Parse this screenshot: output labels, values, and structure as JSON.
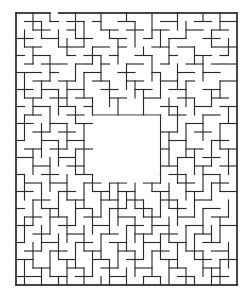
{
  "page": {
    "kind": "maze-puzzle-image",
    "background_color": "#ffffff",
    "width": 252,
    "height": 299
  },
  "header": {
    "name": "top-dark-bar",
    "color": "#3c3c3c",
    "x": 0,
    "y": 0,
    "width": 246,
    "height": 9
  },
  "maze": {
    "title": "",
    "wall_color": "#2b2b2b",
    "path_color": "#ffffff",
    "origin_x": 16,
    "origin_y": 13,
    "cell": 8.5,
    "cols": 26,
    "rows": 32,
    "border": {
      "top_gap_cells": [
        4
      ],
      "bottom_gap_cells": [],
      "left_gap_cells": [],
      "right_gap_cells": []
    },
    "center_room": {
      "col": 9,
      "row": 12,
      "cols": 8,
      "rows": 8
    },
    "h_walls": [
      [
        0,
        0,
        4
      ],
      [
        5,
        0,
        26
      ],
      [
        1,
        1,
        3
      ],
      [
        4,
        1,
        5
      ],
      [
        6,
        1,
        8
      ],
      [
        9,
        1,
        10
      ],
      [
        12,
        1,
        14
      ],
      [
        17,
        1,
        19
      ],
      [
        21,
        1,
        23
      ],
      [
        24,
        1,
        26
      ],
      [
        2,
        2,
        4
      ],
      [
        6,
        2,
        7
      ],
      [
        10,
        2,
        12
      ],
      [
        13,
        2,
        15
      ],
      [
        16,
        2,
        18
      ],
      [
        20,
        2,
        22
      ],
      [
        23,
        2,
        25
      ],
      [
        0,
        3,
        2
      ],
      [
        3,
        3,
        5
      ],
      [
        7,
        3,
        9
      ],
      [
        11,
        3,
        13
      ],
      [
        15,
        3,
        16
      ],
      [
        18,
        3,
        20
      ],
      [
        22,
        3,
        24
      ],
      [
        1,
        4,
        3
      ],
      [
        5,
        4,
        8
      ],
      [
        9,
        4,
        11
      ],
      [
        12,
        4,
        13
      ],
      [
        16,
        4,
        18
      ],
      [
        19,
        4,
        21
      ],
      [
        23,
        4,
        26
      ],
      [
        0,
        5,
        1
      ],
      [
        2,
        5,
        4
      ],
      [
        6,
        5,
        7
      ],
      [
        8,
        5,
        10
      ],
      [
        11,
        5,
        12
      ],
      [
        14,
        5,
        16
      ],
      [
        18,
        5,
        19
      ],
      [
        21,
        5,
        23
      ],
      [
        24,
        5,
        25
      ],
      [
        1,
        6,
        2
      ],
      [
        3,
        6,
        6
      ],
      [
        7,
        6,
        9
      ],
      [
        10,
        6,
        11
      ],
      [
        13,
        6,
        15
      ],
      [
        17,
        6,
        18
      ],
      [
        20,
        6,
        22
      ],
      [
        23,
        6,
        26
      ],
      [
        0,
        7,
        3
      ],
      [
        4,
        7,
        5
      ],
      [
        8,
        7,
        10
      ],
      [
        12,
        7,
        14
      ],
      [
        16,
        7,
        17
      ],
      [
        19,
        7,
        21
      ],
      [
        22,
        7,
        24
      ],
      [
        2,
        8,
        4
      ],
      [
        5,
        8,
        7
      ],
      [
        9,
        8,
        11
      ],
      [
        13,
        8,
        15
      ],
      [
        17,
        8,
        19
      ],
      [
        20,
        8,
        21
      ],
      [
        24,
        8,
        26
      ],
      [
        0,
        9,
        2
      ],
      [
        3,
        9,
        5
      ],
      [
        6,
        9,
        8
      ],
      [
        10,
        9,
        12
      ],
      [
        14,
        9,
        16
      ],
      [
        18,
        9,
        20
      ],
      [
        22,
        9,
        24
      ],
      [
        1,
        10,
        3
      ],
      [
        4,
        10,
        6
      ],
      [
        7,
        10,
        9
      ],
      [
        11,
        10,
        13
      ],
      [
        15,
        10,
        17
      ],
      [
        19,
        10,
        21
      ],
      [
        23,
        10,
        25
      ],
      [
        0,
        11,
        1
      ],
      [
        2,
        11,
        4
      ],
      [
        5,
        11,
        7
      ],
      [
        8,
        11,
        9
      ],
      [
        17,
        11,
        19
      ],
      [
        21,
        11,
        23
      ],
      [
        24,
        11,
        26
      ],
      [
        1,
        12,
        3
      ],
      [
        6,
        12,
        8
      ],
      [
        9,
        12,
        17
      ],
      [
        18,
        12,
        20
      ],
      [
        22,
        12,
        24
      ],
      [
        0,
        13,
        2
      ],
      [
        4,
        13,
        6
      ],
      [
        7,
        13,
        9
      ],
      [
        20,
        13,
        22
      ],
      [
        24,
        13,
        26
      ],
      [
        2,
        14,
        4
      ],
      [
        5,
        14,
        7
      ],
      [
        17,
        14,
        19
      ],
      [
        21,
        14,
        23
      ],
      [
        0,
        15,
        1
      ],
      [
        3,
        15,
        5
      ],
      [
        6,
        15,
        8
      ],
      [
        18,
        15,
        20
      ],
      [
        23,
        15,
        25
      ],
      [
        1,
        16,
        3
      ],
      [
        4,
        16,
        6
      ],
      [
        7,
        16,
        9
      ],
      [
        17,
        16,
        18
      ],
      [
        20,
        16,
        22
      ],
      [
        24,
        16,
        26
      ],
      [
        0,
        17,
        2
      ],
      [
        5,
        17,
        7
      ],
      [
        19,
        17,
        21
      ],
      [
        22,
        17,
        24
      ],
      [
        2,
        18,
        4
      ],
      [
        6,
        18,
        8
      ],
      [
        17,
        18,
        19
      ],
      [
        21,
        18,
        23
      ],
      [
        24,
        18,
        26
      ],
      [
        0,
        19,
        1
      ],
      [
        3,
        19,
        5
      ],
      [
        7,
        19,
        9
      ],
      [
        9,
        19,
        17
      ],
      [
        18,
        19,
        20
      ],
      [
        22,
        19,
        24
      ],
      [
        1,
        20,
        3
      ],
      [
        4,
        20,
        6
      ],
      [
        8,
        20,
        10
      ],
      [
        11,
        20,
        13
      ],
      [
        15,
        20,
        17
      ],
      [
        19,
        20,
        21
      ],
      [
        23,
        20,
        25
      ],
      [
        0,
        21,
        2
      ],
      [
        5,
        21,
        7
      ],
      [
        9,
        21,
        11
      ],
      [
        12,
        21,
        14
      ],
      [
        16,
        21,
        18
      ],
      [
        20,
        21,
        22
      ],
      [
        24,
        21,
        26
      ],
      [
        2,
        22,
        4
      ],
      [
        6,
        22,
        8
      ],
      [
        10,
        22,
        12
      ],
      [
        13,
        22,
        15
      ],
      [
        17,
        22,
        19
      ],
      [
        21,
        22,
        23
      ],
      [
        0,
        23,
        1
      ],
      [
        3,
        23,
        5
      ],
      [
        7,
        23,
        9
      ],
      [
        11,
        23,
        13
      ],
      [
        14,
        23,
        16
      ],
      [
        18,
        23,
        20
      ],
      [
        22,
        23,
        24
      ],
      [
        1,
        24,
        3
      ],
      [
        4,
        24,
        6
      ],
      [
        8,
        24,
        10
      ],
      [
        12,
        24,
        14
      ],
      [
        15,
        24,
        17
      ],
      [
        19,
        24,
        21
      ],
      [
        23,
        24,
        25
      ],
      [
        0,
        25,
        2
      ],
      [
        5,
        25,
        7
      ],
      [
        9,
        25,
        11
      ],
      [
        13,
        25,
        15
      ],
      [
        16,
        25,
        18
      ],
      [
        20,
        25,
        22
      ],
      [
        24,
        25,
        26
      ],
      [
        2,
        26,
        4
      ],
      [
        6,
        26,
        8
      ],
      [
        10,
        26,
        12
      ],
      [
        14,
        26,
        16
      ],
      [
        17,
        26,
        19
      ],
      [
        21,
        26,
        23
      ],
      [
        0,
        27,
        1
      ],
      [
        3,
        27,
        5
      ],
      [
        7,
        27,
        9
      ],
      [
        11,
        27,
        13
      ],
      [
        15,
        27,
        17
      ],
      [
        18,
        27,
        20
      ],
      [
        22,
        27,
        24
      ],
      [
        1,
        28,
        3
      ],
      [
        4,
        28,
        6
      ],
      [
        8,
        28,
        10
      ],
      [
        12,
        28,
        14
      ],
      [
        16,
        28,
        18
      ],
      [
        20,
        28,
        22
      ],
      [
        23,
        28,
        25
      ],
      [
        0,
        29,
        2
      ],
      [
        5,
        29,
        7
      ],
      [
        9,
        29,
        11
      ],
      [
        13,
        29,
        15
      ],
      [
        17,
        29,
        19
      ],
      [
        21,
        29,
        23
      ],
      [
        24,
        29,
        26
      ],
      [
        2,
        30,
        4
      ],
      [
        6,
        30,
        8
      ],
      [
        10,
        30,
        12
      ],
      [
        14,
        30,
        16
      ],
      [
        18,
        30,
        20
      ],
      [
        22,
        30,
        24
      ],
      [
        0,
        31,
        3
      ],
      [
        4,
        31,
        6
      ],
      [
        7,
        31,
        9
      ],
      [
        11,
        31,
        13
      ],
      [
        15,
        31,
        17
      ],
      [
        19,
        31,
        21
      ],
      [
        23,
        31,
        25
      ],
      [
        0,
        32,
        26
      ]
    ],
    "v_walls": [
      [
        0,
        0,
        32
      ],
      [
        26,
        0,
        32
      ],
      [
        2,
        0,
        2
      ],
      [
        4,
        0,
        1
      ],
      [
        7,
        0,
        3
      ],
      [
        10,
        0,
        2
      ],
      [
        13,
        0,
        1
      ],
      [
        16,
        0,
        3
      ],
      [
        19,
        0,
        2
      ],
      [
        22,
        0,
        1
      ],
      [
        24,
        0,
        2
      ],
      [
        1,
        2,
        4
      ],
      [
        3,
        1,
        3
      ],
      [
        5,
        2,
        4
      ],
      [
        8,
        1,
        4
      ],
      [
        11,
        2,
        3
      ],
      [
        14,
        1,
        4
      ],
      [
        17,
        2,
        4
      ],
      [
        20,
        1,
        3
      ],
      [
        23,
        2,
        4
      ],
      [
        2,
        4,
        6
      ],
      [
        6,
        3,
        5
      ],
      [
        9,
        4,
        6
      ],
      [
        12,
        3,
        6
      ],
      [
        15,
        4,
        5
      ],
      [
        18,
        3,
        6
      ],
      [
        21,
        4,
        6
      ],
      [
        25,
        3,
        5
      ],
      [
        4,
        5,
        8
      ],
      [
        7,
        6,
        8
      ],
      [
        10,
        5,
        8
      ],
      [
        13,
        6,
        9
      ],
      [
        16,
        5,
        8
      ],
      [
        19,
        6,
        9
      ],
      [
        22,
        5,
        8
      ],
      [
        1,
        7,
        10
      ],
      [
        3,
        8,
        10
      ],
      [
        6,
        8,
        11
      ],
      [
        8,
        7,
        10
      ],
      [
        11,
        8,
        11
      ],
      [
        14,
        8,
        10
      ],
      [
        17,
        7,
        10
      ],
      [
        20,
        8,
        11
      ],
      [
        24,
        8,
        10
      ],
      [
        2,
        10,
        12
      ],
      [
        5,
        9,
        12
      ],
      [
        9,
        10,
        12
      ],
      [
        12,
        10,
        12
      ],
      [
        15,
        9,
        12
      ],
      [
        18,
        10,
        12
      ],
      [
        21,
        10,
        12
      ],
      [
        23,
        9,
        11
      ],
      [
        4,
        11,
        14
      ],
      [
        7,
        11,
        13
      ],
      [
        19,
        11,
        14
      ],
      [
        25,
        11,
        13
      ],
      [
        1,
        12,
        15
      ],
      [
        6,
        13,
        16
      ],
      [
        22,
        12,
        15
      ],
      [
        3,
        13,
        17
      ],
      [
        8,
        13,
        19
      ],
      [
        17,
        12,
        20
      ],
      [
        20,
        13,
        17
      ],
      [
        24,
        13,
        16
      ],
      [
        5,
        15,
        18
      ],
      [
        18,
        14,
        18
      ],
      [
        23,
        15,
        18
      ],
      [
        2,
        16,
        19
      ],
      [
        7,
        16,
        19
      ],
      [
        21,
        16,
        19
      ],
      [
        25,
        16,
        19
      ],
      [
        4,
        17,
        21
      ],
      [
        19,
        17,
        20
      ],
      [
        22,
        18,
        21
      ],
      [
        1,
        19,
        22
      ],
      [
        6,
        19,
        22
      ],
      [
        9,
        19,
        21
      ],
      [
        12,
        19,
        22
      ],
      [
        16,
        19,
        21
      ],
      [
        20,
        19,
        22
      ],
      [
        24,
        19,
        21
      ],
      [
        3,
        20,
        23
      ],
      [
        8,
        20,
        23
      ],
      [
        11,
        20,
        22
      ],
      [
        14,
        20,
        23
      ],
      [
        18,
        20,
        23
      ],
      [
        23,
        20,
        22
      ],
      [
        5,
        21,
        24
      ],
      [
        10,
        21,
        24
      ],
      [
        13,
        21,
        23
      ],
      [
        17,
        21,
        24
      ],
      [
        21,
        21,
        24
      ],
      [
        2,
        22,
        25
      ],
      [
        7,
        22,
        25
      ],
      [
        12,
        22,
        25
      ],
      [
        15,
        22,
        24
      ],
      [
        19,
        22,
        25
      ],
      [
        25,
        22,
        24
      ],
      [
        4,
        23,
        26
      ],
      [
        9,
        23,
        26
      ],
      [
        11,
        23,
        26
      ],
      [
        16,
        23,
        26
      ],
      [
        22,
        23,
        26
      ],
      [
        1,
        24,
        27
      ],
      [
        6,
        24,
        27
      ],
      [
        14,
        24,
        27
      ],
      [
        18,
        24,
        27
      ],
      [
        24,
        24,
        27
      ],
      [
        3,
        25,
        28
      ],
      [
        8,
        25,
        28
      ],
      [
        13,
        25,
        28
      ],
      [
        20,
        25,
        28
      ],
      [
        23,
        25,
        27
      ],
      [
        5,
        26,
        29
      ],
      [
        10,
        26,
        29
      ],
      [
        15,
        26,
        29
      ],
      [
        17,
        26,
        29
      ],
      [
        21,
        26,
        29
      ],
      [
        2,
        27,
        30
      ],
      [
        7,
        27,
        30
      ],
      [
        12,
        27,
        30
      ],
      [
        19,
        27,
        30
      ],
      [
        25,
        27,
        30
      ],
      [
        4,
        28,
        31
      ],
      [
        9,
        28,
        31
      ],
      [
        14,
        28,
        31
      ],
      [
        16,
        28,
        31
      ],
      [
        22,
        28,
        31
      ],
      [
        1,
        29,
        32
      ],
      [
        6,
        29,
        32
      ],
      [
        11,
        29,
        32
      ],
      [
        18,
        29,
        32
      ],
      [
        24,
        29,
        32
      ],
      [
        3,
        30,
        32
      ],
      [
        8,
        30,
        32
      ],
      [
        13,
        30,
        32
      ],
      [
        20,
        30,
        32
      ],
      [
        23,
        30,
        32
      ],
      [
        5,
        31,
        32
      ],
      [
        10,
        31,
        32
      ],
      [
        15,
        31,
        32
      ],
      [
        17,
        31,
        32
      ],
      [
        21,
        31,
        32
      ]
    ]
  }
}
